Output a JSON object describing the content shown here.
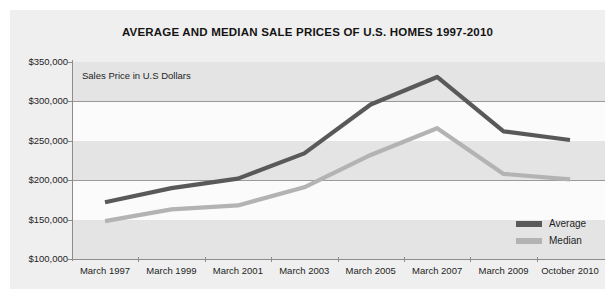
{
  "chart_data": {
    "type": "line",
    "title": "AVERAGE AND MEDIAN SALE PRICES OF U.S. HOMES 1997-2010",
    "axis_note": "Sales Price in U.S Dollars",
    "xlabel": "",
    "ylabel": "Sales Price in U.S Dollars",
    "categories": [
      "March 1997",
      "March 1999",
      "March 2001",
      "March 2003",
      "March 2005",
      "March 2007",
      "March 2009",
      "October 2010"
    ],
    "series": [
      {
        "name": "Average",
        "color": "#595959",
        "values": [
          172000,
          190000,
          202000,
          234000,
          296000,
          331000,
          262000,
          251000
        ]
      },
      {
        "name": "Median",
        "color": "#b3b3b3",
        "values": [
          148000,
          163000,
          168000,
          191000,
          232000,
          266000,
          208000,
          201000
        ]
      }
    ],
    "ylim": [
      100000,
      350000
    ],
    "ytick_values": [
      350000,
      300000,
      250000,
      200000,
      150000,
      100000
    ],
    "ytick_labels": [
      "$350,000",
      "$300,000",
      "$250,000",
      "$200,000",
      "$150,000",
      "$100,000"
    ],
    "grid": "horizontal-banded",
    "legend_position": "bottom-right"
  },
  "legend": {
    "items": [
      {
        "label": "Average",
        "color": "#595959"
      },
      {
        "label": "Median",
        "color": "#b3b3b3"
      }
    ]
  },
  "colors": {
    "panel_background": "#efefef",
    "band_shade": "#e4e4e4",
    "band_light": "#fbfbfb",
    "axis": "#8c8c8c",
    "gridline": "#9a9a9a",
    "text": "#1e1e1e",
    "title": "#141414",
    "average_line": "#595959",
    "median_line": "#b3b3b3"
  }
}
